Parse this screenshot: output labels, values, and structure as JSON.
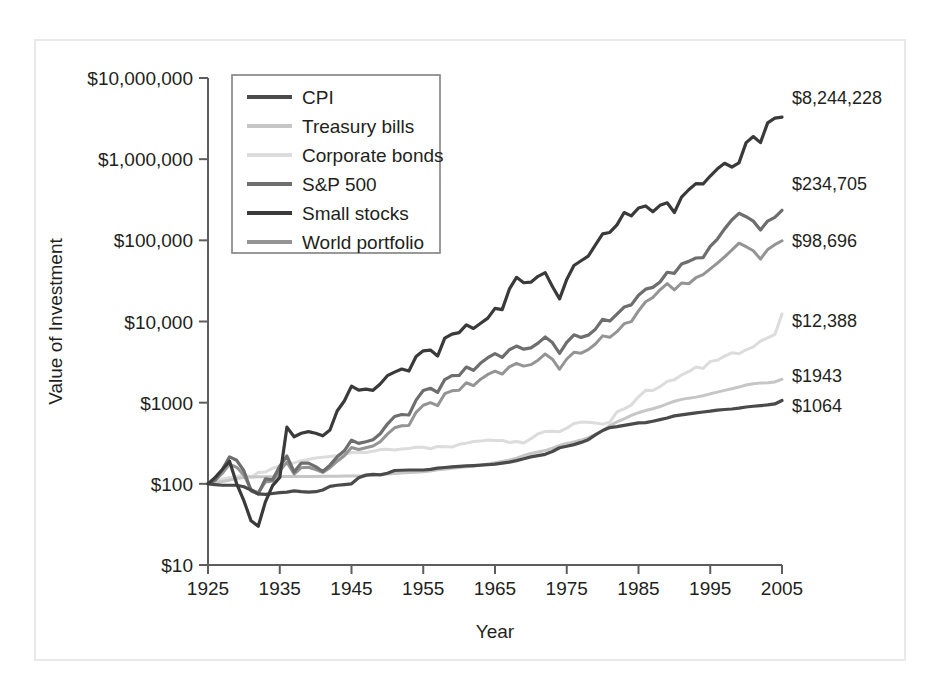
{
  "figure": {
    "name": "value-of-investment-1925-2005",
    "frame_color": "#e9e9e9",
    "background": "#ffffff"
  },
  "axes": {
    "y_label": "Value of Investment",
    "x_label": "Year",
    "y_ticks": [
      "$10",
      "$100",
      "$1000",
      "$10,000",
      "$100,000",
      "$1,000,000",
      "$10,000,000"
    ],
    "x_ticks": [
      "1925",
      "1935",
      "1945",
      "1955",
      "1965",
      "1975",
      "1985",
      "1995",
      "2005"
    ]
  },
  "legend": {
    "items": [
      {
        "label": "CPI",
        "color": "#4a4a4a"
      },
      {
        "label": "Treasury bills",
        "color": "#c6c6c6"
      },
      {
        "label": "Corporate bonds",
        "color": "#dcdcdc"
      },
      {
        "label": "S&P 500",
        "color": "#6e6e6e"
      },
      {
        "label": "Small stocks",
        "color": "#3a3a3a"
      },
      {
        "label": "World portfolio",
        "color": "#949494"
      }
    ]
  },
  "end_labels": [
    {
      "text": "$8,244,228",
      "series": "Small stocks"
    },
    {
      "text": "$234,705",
      "series": "S&P 500"
    },
    {
      "text": "$98,696",
      "series": "World portfolio"
    },
    {
      "text": "$12,388",
      "series": "Corporate bonds"
    },
    {
      "text": "$1943",
      "series": "Treasury bills"
    },
    {
      "text": "$1064",
      "series": "CPI"
    }
  ],
  "chart_data": {
    "type": "line",
    "title": "",
    "xlabel": "Year",
    "ylabel": "Value of Investment",
    "xlim": [
      1925,
      2005
    ],
    "ylim": [
      10,
      10000000
    ],
    "yscale": "log",
    "grid": false,
    "legend_position": "upper-left-inside",
    "x": [
      1925,
      1926,
      1927,
      1928,
      1929,
      1930,
      1931,
      1932,
      1933,
      1934,
      1935,
      1936,
      1937,
      1938,
      1939,
      1940,
      1941,
      1942,
      1943,
      1944,
      1945,
      1946,
      1947,
      1948,
      1949,
      1950,
      1951,
      1952,
      1953,
      1954,
      1955,
      1956,
      1957,
      1958,
      1959,
      1960,
      1961,
      1962,
      1963,
      1964,
      1965,
      1966,
      1967,
      1968,
      1969,
      1970,
      1971,
      1972,
      1973,
      1974,
      1975,
      1976,
      1977,
      1978,
      1979,
      1980,
      1981,
      1982,
      1983,
      1984,
      1985,
      1986,
      1987,
      1988,
      1989,
      1990,
      1991,
      1992,
      1993,
      1994,
      1995,
      1996,
      1997,
      1998,
      1999,
      2000,
      2001,
      2002,
      2003,
      2004,
      2005
    ],
    "series": [
      {
        "name": "Small stocks",
        "color": "#3a3a3a",
        "end_value": 8244228,
        "values": [
          100,
          120,
          150,
          190,
          100,
          62,
          35,
          30,
          60,
          95,
          120,
          500,
          380,
          420,
          440,
          420,
          390,
          460,
          790,
          1050,
          1600,
          1430,
          1470,
          1420,
          1700,
          2150,
          2380,
          2600,
          2450,
          3700,
          4350,
          4450,
          3750,
          6250,
          7000,
          7300,
          9100,
          8200,
          9500,
          11000,
          14500,
          14000,
          25000,
          35000,
          30000,
          30500,
          36000,
          40000,
          27000,
          19000,
          33000,
          49000,
          56000,
          64000,
          88000,
          120000,
          125000,
          155000,
          220000,
          200000,
          250000,
          265000,
          225000,
          270000,
          290000,
          220000,
          340000,
          420000,
          500000,
          495000,
          620000,
          760000,
          890000,
          800000,
          900000,
          1600000,
          1900000,
          1600000,
          2800000,
          3200000,
          3300000
        ]
      },
      {
        "name": "S&P 500",
        "color": "#6e6e6e",
        "end_value": 234705,
        "values": [
          100,
          112,
          150,
          215,
          195,
          145,
          82,
          75,
          115,
          112,
          165,
          220,
          140,
          180,
          180,
          163,
          142,
          170,
          215,
          255,
          345,
          315,
          330,
          350,
          415,
          545,
          675,
          715,
          705,
          1075,
          1415,
          1505,
          1340,
          1925,
          2155,
          2165,
          2745,
          2505,
          3075,
          3580,
          4025,
          3620,
          4485,
          4980,
          4560,
          4740,
          5415,
          6440,
          5495,
          4040,
          5540,
          6860,
          6370,
          6790,
          8045,
          10650,
          10125,
          12300,
          15075,
          16020,
          21100,
          25030,
          26345,
          30700,
          40450,
          39200,
          51150,
          55050,
          60550,
          61350,
          84400,
          103800,
          138400,
          177900,
          215300,
          195600,
          172400,
          134300,
          172700,
          191500,
          234705
        ]
      },
      {
        "name": "World portfolio",
        "color": "#949494",
        "end_value": 98696,
        "values": [
          100,
          110,
          135,
          175,
          160,
          128,
          85,
          78,
          105,
          108,
          145,
          185,
          132,
          158,
          160,
          150,
          138,
          158,
          190,
          222,
          280,
          265,
          278,
          292,
          330,
          410,
          490,
          520,
          525,
          760,
          930,
          1000,
          920,
          1290,
          1400,
          1425,
          1760,
          1620,
          1950,
          2230,
          2440,
          2250,
          2760,
          3050,
          2820,
          2940,
          3340,
          3980,
          3430,
          2580,
          3450,
          4170,
          4070,
          4500,
          5280,
          6650,
          6380,
          7500,
          9400,
          9950,
          13500,
          17500,
          19800,
          24600,
          29300,
          24500,
          29800,
          29200,
          34600,
          37800,
          44500,
          52500,
          62600,
          75600,
          92300,
          83500,
          74500,
          58700,
          77000,
          88500,
          98696
        ]
      },
      {
        "name": "Corporate bonds",
        "color": "#dcdcdc",
        "end_value": 12388,
        "values": [
          100,
          107,
          115,
          119,
          122,
          131,
          121,
          138,
          140,
          155,
          166,
          178,
          181,
          193,
          200,
          208,
          212,
          217,
          223,
          232,
          243,
          245,
          243,
          252,
          264,
          267,
          261,
          268,
          273,
          283,
          283,
          271,
          288,
          286,
          284,
          307,
          317,
          332,
          336,
          346,
          341,
          343,
          323,
          333,
          319,
          359,
          413,
          442,
          446,
          439,
          485,
          554,
          576,
          574,
          560,
          544,
          576,
          769,
          838,
          936,
          1179,
          1418,
          1414,
          1574,
          1830,
          1917,
          2195,
          2411,
          2757,
          2637,
          3227,
          3331,
          3740,
          4118,
          4008,
          4483,
          4870,
          5727,
          6295,
          6920,
          12388
        ]
      },
      {
        "name": "Treasury bills",
        "color": "#c6c6c6",
        "end_value": 1943,
        "values": [
          100,
          103,
          107,
          111,
          116,
          120,
          121,
          122,
          122,
          122,
          123,
          123,
          123,
          123,
          123,
          123,
          124,
          124,
          124,
          125,
          125,
          125,
          126,
          128,
          130,
          132,
          134,
          136,
          138,
          139,
          141,
          144,
          149,
          151,
          155,
          159,
          162,
          165,
          170,
          176,
          182,
          189,
          197,
          207,
          223,
          237,
          247,
          257,
          275,
          297,
          314,
          329,
          346,
          370,
          407,
          452,
          522,
          581,
          633,
          697,
          752,
          800,
          842,
          896,
          965,
          1041,
          1098,
          1137,
          1170,
          1217,
          1285,
          1349,
          1417,
          1485,
          1556,
          1649,
          1714,
          1743,
          1761,
          1799,
          1943
        ]
      },
      {
        "name": "CPI",
        "color": "#4a4a4a",
        "end_value": 1064,
        "values": [
          100,
          98,
          96,
          96,
          96,
          92,
          84,
          75,
          74,
          76,
          78,
          79,
          82,
          80,
          79,
          80,
          84,
          93,
          96,
          98,
          100,
          119,
          128,
          131,
          129,
          135,
          146,
          147,
          148,
          148,
          148,
          151,
          156,
          159,
          162,
          164,
          166,
          168,
          170,
          172,
          175,
          180,
          185,
          193,
          204,
          215,
          223,
          231,
          250,
          278,
          290,
          304,
          324,
          350,
          401,
          454,
          493,
          506,
          525,
          545,
          563,
          567,
          591,
          618,
          647,
          687,
          707,
          729,
          749,
          768,
          787,
          811,
          824,
          836,
          855,
          885,
          904,
          919,
          938,
          964,
          1064
        ]
      }
    ]
  }
}
